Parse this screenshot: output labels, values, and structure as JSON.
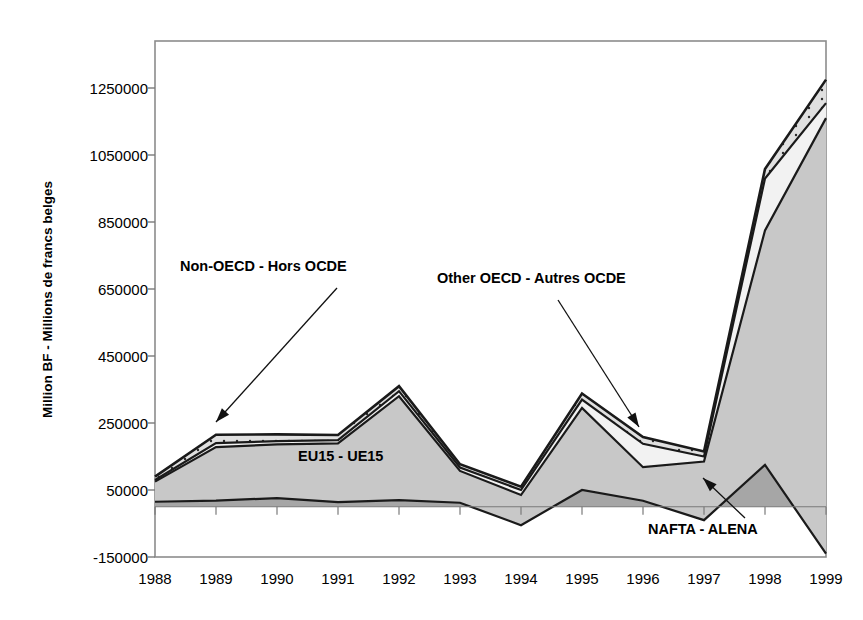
{
  "chart_data": {
    "type": "area",
    "stacked": true,
    "title": "",
    "xlabel": "",
    "ylabel": "Million BF - Millions de francs belges",
    "categories": [
      "1988",
      "1989",
      "1990",
      "1991",
      "1992",
      "1993",
      "1994",
      "1995",
      "1996",
      "1997",
      "1998",
      "1999"
    ],
    "x": [
      1988,
      1989,
      1990,
      1991,
      1992,
      1993,
      1994,
      1995,
      1996,
      1997,
      1998,
      1999
    ],
    "ylim": [
      -150000,
      1350000
    ],
    "yticks": [
      -150000,
      50000,
      250000,
      450000,
      650000,
      850000,
      1050000,
      1250000
    ],
    "ytick_labels": [
      "-150000",
      "50000",
      "250000",
      "450000",
      "650000",
      "850000",
      "1050000",
      "1250000"
    ],
    "grid": false,
    "legend_position": "inline-annotations",
    "series": [
      {
        "name": "NAFTA - ALENA",
        "label": "NAFTA - ALENA",
        "color": "#a6a6a6",
        "values": [
          15000,
          18000,
          26000,
          14000,
          20000,
          12000,
          -55000,
          50000,
          18000,
          -40000,
          125000,
          -140000
        ]
      },
      {
        "name": "EU15 - UE15",
        "label": "EU15 - UE15",
        "color": "#c8c8c8",
        "values": [
          60000,
          160000,
          160000,
          175000,
          310000,
          95000,
          90000,
          245000,
          100000,
          175000,
          700000,
          1300000
        ]
      },
      {
        "name": "Other OECD - Autres OCDE",
        "label": "Other OECD - Autres OCDE",
        "color": "#f2f2f2",
        "values": [
          5000,
          12000,
          10000,
          10000,
          15000,
          10000,
          15000,
          25000,
          70000,
          15000,
          155000,
          45000
        ]
      },
      {
        "name": "Non-OECD - Hors OCDE",
        "label": "Non-OECD - Hors OCDE",
        "color": "#e0e0e0",
        "values": [
          10000,
          25000,
          20000,
          15000,
          15000,
          10000,
          10000,
          18000,
          20000,
          15000,
          28000,
          70000
        ]
      }
    ],
    "annotations": [
      {
        "text": "Non-OECD - Hors OCDE",
        "target_year": "1989"
      },
      {
        "text": "Other OECD - Autres OCDE",
        "target_year": "1996"
      },
      {
        "text": "EU15 - UE15",
        "target_year": "1991"
      },
      {
        "text": "NAFTA - ALENA",
        "target_year": "1998"
      }
    ]
  },
  "axis": {
    "ylabel": "Million BF - Millions de francs belges",
    "ytick_labels": [
      "1250000",
      "1050000",
      "850000",
      "650000",
      "450000",
      "250000",
      "50000",
      "-150000"
    ],
    "xtick_labels": [
      "1988",
      "1989",
      "1990",
      "1991",
      "1992",
      "1993",
      "1994",
      "1995",
      "1996",
      "1997",
      "1998",
      "1999"
    ]
  },
  "annotations": {
    "non_oecd": "Non-OECD - Hors OCDE",
    "other_oecd": "Other OECD - Autres OCDE",
    "eu15": "EU15 - UE15",
    "nafta": "NAFTA - ALENA"
  },
  "colors": {
    "nafta": "#a6a6a6",
    "eu15": "#c8c8c8",
    "other_oecd": "#f2f2f2",
    "non_oecd": "#e0e0e0",
    "outline": "#1a1a1a",
    "frame": "#8c8c8c"
  }
}
